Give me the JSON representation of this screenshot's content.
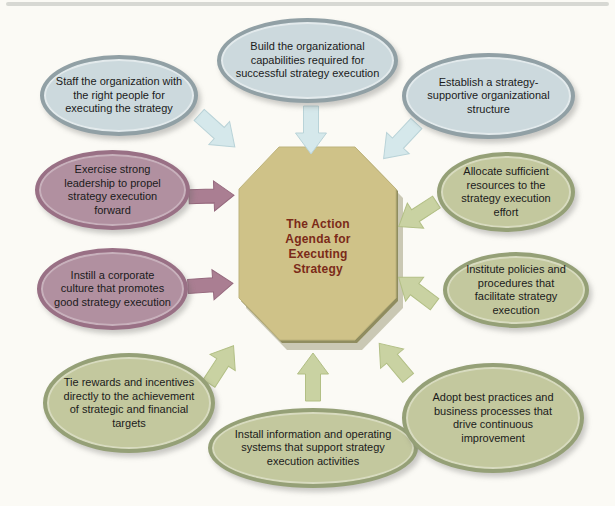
{
  "diagram": {
    "title": "The Action Agenda for Executing Strategy",
    "center": {
      "shape": "octagon",
      "lines": [
        "The Action",
        "Agenda for",
        "Executing",
        "Strategy"
      ],
      "fill": "#cfc288",
      "edge": "#8f8c5f",
      "text_color": "#7b2a18"
    },
    "nodes": [
      {
        "id": "staff",
        "group": "blue",
        "text": "Staff the organization with the right people for executing the strategy"
      },
      {
        "id": "capabilities",
        "group": "blue",
        "text": "Build the organizational capabilities required for successful strategy execution"
      },
      {
        "id": "structure",
        "group": "blue",
        "text": "Establish a strategy-supportive organizational structure"
      },
      {
        "id": "leadership",
        "group": "mauve",
        "text": "Exercise strong leadership to propel strategy execution forward"
      },
      {
        "id": "culture",
        "group": "mauve",
        "text": "Instill a corporate culture that promotes good strategy execution"
      },
      {
        "id": "rewards",
        "group": "green",
        "text": "Tie rewards and incentives directly to the achievement of strategic and financial targets"
      },
      {
        "id": "systems",
        "group": "green",
        "text": "Install information and operating systems that support strategy execution activities"
      },
      {
        "id": "practices",
        "group": "green",
        "text": "Adopt best practices and business processes that drive continuous improvement"
      },
      {
        "id": "resources",
        "group": "green",
        "text": "Allocate sufficient resources to the strategy execution effort"
      },
      {
        "id": "policies",
        "group": "green",
        "text": "Institute policies and procedures that facilitate strategy execution"
      }
    ],
    "icons": [
      {
        "name": "arrow-staff-icon",
        "direction": "down-right",
        "color": "#d5e8eb"
      },
      {
        "name": "arrow-capabilities-icon",
        "direction": "down",
        "color": "#d5e8eb"
      },
      {
        "name": "arrow-structure-icon",
        "direction": "down-left",
        "color": "#d5e8eb"
      },
      {
        "name": "arrow-leadership-icon",
        "direction": "right",
        "color": "#aa7e92"
      },
      {
        "name": "arrow-culture-icon",
        "direction": "right",
        "color": "#aa7e92"
      },
      {
        "name": "arrow-resources-icon",
        "direction": "down-left",
        "color": "#c9d2a2"
      },
      {
        "name": "arrow-policies-icon",
        "direction": "left",
        "color": "#c9d2a2"
      },
      {
        "name": "arrow-rewards-icon",
        "direction": "up-right",
        "color": "#c9d2a2"
      },
      {
        "name": "arrow-systems-icon",
        "direction": "up",
        "color": "#c9d2a2"
      },
      {
        "name": "arrow-practices-icon",
        "direction": "up-left",
        "color": "#c9d2a2"
      }
    ],
    "colors": {
      "background": "#fbfaf5",
      "page_edge": "#d7d8d3",
      "blue_fill": "#ccd9dd",
      "blue_border": "#91a0a5",
      "mauve_fill": "#b190a0",
      "mauve_border": "#997085",
      "green_fill": "#c3c89e",
      "green_border": "#95a077",
      "octagon_fill": "#cfc288",
      "octagon_edge": "#8f8c5f",
      "node_text": "#1b1b1b",
      "center_text": "#7b2a18"
    }
  }
}
